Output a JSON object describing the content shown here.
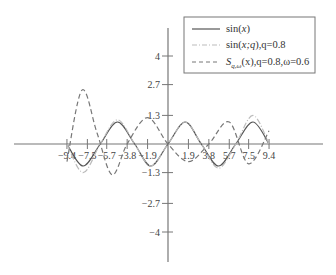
{
  "chart_data": {
    "type": "line",
    "title": "",
    "xlabel": "",
    "ylabel": "",
    "xlim": [
      -9.4,
      9.4
    ],
    "ylim": [
      -4,
      4
    ],
    "grid": false,
    "legend_position": "upper right",
    "x_ticks": [
      -9.4,
      -7.5,
      -5.7,
      -3.8,
      -1.9,
      1.9,
      3.8,
      5.7,
      7.5,
      9.4
    ],
    "x_tick_labels": [
      "-9.4",
      "-7.5",
      "-5.7",
      "-3.8",
      "-1.9",
      "1.9",
      "3.8",
      "5.7",
      "7.5",
      "9.4"
    ],
    "y_ticks": [
      4,
      2.7,
      1.3,
      -1.3,
      -2.7,
      -4
    ],
    "y_tick_labels": [
      "4",
      "2.7",
      "1.3",
      "-1.3",
      "-2.7",
      "-4"
    ],
    "series": [
      {
        "name": "sin(x)",
        "style": "solid",
        "color": "#555555",
        "x": [
          -9.4,
          -7.9,
          -6.3,
          -4.7,
          -3.1,
          -1.6,
          0,
          1.6,
          3.1,
          4.7,
          6.3,
          7.9,
          9.4
        ],
        "values": [
          0,
          -1,
          0,
          1,
          0,
          -1,
          0,
          1,
          0,
          -1,
          0,
          1,
          0
        ]
      },
      {
        "name": "sin(x;q), q=0.8",
        "style": "dashdot",
        "color": "#bbbbbb",
        "x": [
          -9.4,
          -7.9,
          -6.3,
          -4.7,
          -3.1,
          -1.6,
          0,
          1.6,
          3.1,
          4.7,
          6.3,
          7.9,
          9.4
        ],
        "values": [
          0,
          -1.3,
          0,
          1.1,
          0,
          -1.0,
          0,
          1.0,
          0,
          -1.1,
          0,
          1.3,
          0
        ]
      },
      {
        "name": "S_{q,ω}(x), q=0.8, ω=0.6",
        "style": "dashed",
        "color": "#777777",
        "x": [
          -9.4,
          -8.0,
          -6.6,
          -5.2,
          -3.8,
          -1.9,
          0,
          1.9,
          3.8,
          5.7,
          7.5,
          9.4
        ],
        "values": [
          -0.8,
          2.45,
          0.5,
          -1.4,
          0,
          1.2,
          0,
          -0.8,
          0,
          1.0,
          -0.9,
          0.6
        ]
      }
    ]
  },
  "legend": {
    "items": [
      {
        "label_main": "sin(",
        "label_var": "x",
        "label_end": ")"
      },
      {
        "label_main": "sin(",
        "label_var": "x;q",
        "label_end": "),q=0.8"
      },
      {
        "label_main": "S",
        "label_sub": "q,ω",
        "label_end": "(x),q=0.8,ω=0.6"
      }
    ]
  }
}
